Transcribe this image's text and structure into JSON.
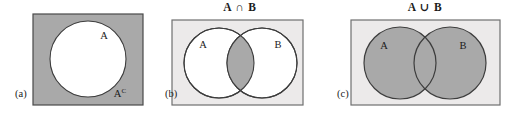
{
  "figure": {
    "width": 520,
    "height": 118,
    "background": "#ffffff"
  },
  "colors": {
    "shade_gray": "#a9a9a9",
    "light_gray": "#eceaea",
    "outline": "#4a4a4a",
    "text": "#1b1b1b",
    "white": "#ffffff"
  },
  "panels": [
    {
      "id": "a",
      "caption": "(a)",
      "title": "",
      "description": "complement-of-A",
      "rect": {
        "x": 33,
        "y": 14,
        "width": 110,
        "height": 91,
        "fill": "#a9a9a9"
      },
      "circles": [
        {
          "name": "A",
          "cx": 88,
          "cy": 59,
          "r": 38,
          "fill": "#ffffff"
        }
      ],
      "labels": [
        {
          "name": "label-A",
          "text": "A",
          "superscript": "",
          "x": 104,
          "y": 39
        },
        {
          "name": "label-A-complement",
          "text": "A",
          "superscript": "C",
          "x": 120,
          "y": 97
        }
      ]
    },
    {
      "id": "b",
      "caption": "(b)",
      "title": "A ∩ B",
      "description": "intersection-of-A-and-B",
      "rect": {
        "x": 172,
        "y": 20,
        "width": 131,
        "height": 85,
        "fill": "#eceaea"
      },
      "circles": [
        {
          "name": "A",
          "cx": 219,
          "cy": 63,
          "r": 35,
          "fill": "#ffffff"
        },
        {
          "name": "B",
          "cx": 262,
          "cy": 63,
          "r": 35,
          "fill": "#ffffff"
        }
      ],
      "shaded_region": "intersection",
      "shaded_fill": "#a9a9a9",
      "labels": [
        {
          "name": "label-A",
          "text": "A",
          "superscript": "",
          "x": 203,
          "y": 48
        },
        {
          "name": "label-B",
          "text": "B",
          "superscript": "",
          "x": 278,
          "y": 48
        }
      ]
    },
    {
      "id": "c",
      "caption": "(c)",
      "title": "A ∪ B",
      "description": "union-of-A-and-B",
      "rect": {
        "x": 351,
        "y": 20,
        "width": 149,
        "height": 85,
        "fill": "#eceaea"
      },
      "circles": [
        {
          "name": "A",
          "cx": 400,
          "cy": 63,
          "r": 36,
          "fill": "#a9a9a9"
        },
        {
          "name": "B",
          "cx": 450,
          "cy": 63,
          "r": 36,
          "fill": "#a9a9a9"
        }
      ],
      "shaded_region": "union",
      "shaded_fill": "#a9a9a9",
      "labels": [
        {
          "name": "label-A",
          "text": "A",
          "superscript": "",
          "x": 384,
          "y": 49
        },
        {
          "name": "label-B",
          "text": "B",
          "superscript": "",
          "x": 463,
          "y": 49
        }
      ]
    }
  ],
  "captions": {
    "a": "(a)",
    "b": "(b)",
    "c": "(c)"
  },
  "titles": {
    "b": "A ∩ B",
    "c": "A ∪ B"
  }
}
